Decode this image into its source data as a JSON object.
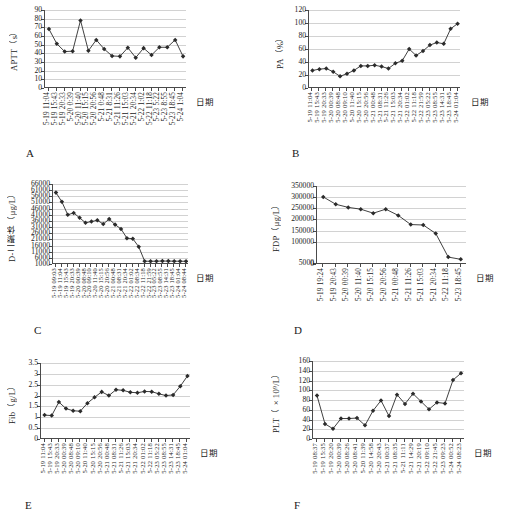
{
  "figure": {
    "axis_title_cn": "日期",
    "panels": [
      {
        "letter": "A",
        "chart_data": {
          "type": "line",
          "title": "",
          "ylabel": "APTT（s）",
          "ylabel_main": "APTT",
          "ylabel_unit": "（s）",
          "xlabel": "日期",
          "ylim": [
            0,
            90
          ],
          "yticks": [
            0,
            10,
            20,
            30,
            40,
            50,
            60,
            70,
            80,
            90
          ],
          "grid": true,
          "legend": "none",
          "categories": [
            "5-19 11:04",
            "5-19 15:43",
            "5-19 20:33",
            "5-20 0:39",
            "5-20 11:40",
            "5-20 15:15",
            "5-20 20:56",
            "5-21 0:48",
            "5-21 8:31",
            "5-21 11:26",
            "5-21 15:03",
            "5-21 20:34",
            "5-22 1:02",
            "5-22 11:18",
            "5-23 5:22",
            "5-23 8:55",
            "5-23 18:45",
            "5-24 1:04"
          ],
          "values": [
            68,
            51,
            42,
            42.5,
            78,
            43,
            55.5,
            45,
            37,
            36.5,
            46.5,
            35,
            46,
            38,
            47,
            47,
            55.5,
            36.5
          ]
        }
      },
      {
        "letter": "B",
        "chart_data": {
          "type": "line",
          "title": "",
          "ylabel": "PA（%）",
          "ylabel_main": "PA",
          "ylabel_unit": "（%）",
          "xlabel": "日期",
          "ylim": [
            0,
            120
          ],
          "yticks": [
            0,
            20,
            40,
            60,
            80,
            100,
            120
          ],
          "grid": true,
          "legend": "none",
          "categories": [
            "5-19 11:04",
            "5-19 15:43",
            "5-19 20:33",
            "5-20 00:39",
            "5-20 08:48",
            "5-20 09:10",
            "5-20 11:40",
            "5-20 15:15",
            "5-20 20:56",
            "5-21 00:48",
            "5-21 08:31",
            "5-21 11:26",
            "5-21 15:03",
            "5-21 20:34",
            "5-22 01:02",
            "5-22 11:18",
            "5-22 21:59",
            "5-23 05:22",
            "5-23 08:55",
            "5-23 14:31",
            "5-23 18:45",
            "5-24 01:04"
          ],
          "values": [
            27,
            29,
            30,
            25,
            18,
            22,
            27,
            34,
            34,
            35,
            33,
            30,
            38,
            42,
            60,
            50,
            57,
            66,
            70,
            68,
            91,
            99
          ]
        }
      },
      {
        "letter": "C",
        "chart_data": {
          "type": "line",
          "title": "",
          "ylabel": "D-二聚体（μg/L）",
          "ylabel_main": "D-二聚体",
          "ylabel_unit": "（μg/L）",
          "xlabel": "日期",
          "ylim": [
            1000,
            66000
          ],
          "yticks": [
            1000,
            6000,
            11000,
            16000,
            21000,
            26000,
            31000,
            36000,
            41000,
            46000,
            51000,
            56000,
            61000,
            66000
          ],
          "grid": true,
          "legend": "none",
          "categories": [
            "5-19 09:03",
            "5-19 11:04",
            "5-19 15:43",
            "5-19 20:33",
            "5-20 00:39",
            "5-20 08:48",
            "5-20 09:10",
            "5-20 11:40",
            "5-20 15:15",
            "5-20 20:56",
            "5-21 00:48",
            "5-21 08:31",
            "5-21 20:34",
            "5-22 01:02",
            "5-22 08:34",
            "5-22 11:18",
            "5-22 21:59",
            "5-23 05:22",
            "5-23 08:55",
            "5-23 14:31",
            "5-23 18:45",
            "5-24 01:04",
            "5-24 08:44"
          ],
          "values": [
            59000,
            51500,
            41000,
            42500,
            38500,
            34500,
            35500,
            36500,
            33500,
            37500,
            33000,
            29500,
            22000,
            21500,
            15000,
            3300,
            3200,
            3300,
            3400,
            3350,
            3300,
            3250,
            3200
          ]
        }
      },
      {
        "letter": "D",
        "chart_data": {
          "type": "line",
          "title": "",
          "ylabel": "FDP（μg/L）",
          "ylabel_main": "FDP",
          "ylabel_unit": "（μg/L）",
          "xlabel": "日期",
          "ylim": [
            0,
            350000
          ],
          "yticks": [
            0,
            5000,
            100000,
            150000,
            200000,
            250000,
            300000,
            350000
          ],
          "ytick_labels": [
            "0",
            "5000",
            "100000",
            "150000",
            "200000",
            "250000",
            "300000",
            "350000"
          ],
          "grid": true,
          "legend": "none",
          "categories": [
            "5-19 19:24",
            "5-19 20:43",
            "5-20 00:39",
            "5-20 11:40",
            "5-20 15:15",
            "5-20 20:56",
            "5-21 00:48",
            "5-21 11:26",
            "5-21 15:03",
            "5-21 20:34",
            "5-22 11:18",
            "5-23 18:45"
          ],
          "values": [
            301000,
            268000,
            254000,
            246000,
            228000,
            246000,
            218000,
            177000,
            175000,
            137000,
            31000,
            21000
          ]
        }
      },
      {
        "letter": "E",
        "chart_data": {
          "type": "line",
          "title": "",
          "ylabel": "Fib（g/L）",
          "ylabel_main": "Fib",
          "ylabel_unit": "（g/L）",
          "xlabel": "日期",
          "ylim": [
            0,
            3.5
          ],
          "yticks": [
            0,
            0.5,
            1,
            1.5,
            2,
            2.5,
            3,
            3.5
          ],
          "grid": true,
          "legend": "none",
          "categories": [
            "5-19 11:04",
            "5-19 15:43",
            "5-19 20:33",
            "5-20 00:39",
            "5-20 08:48",
            "5-20 09:10",
            "5-20 11:40",
            "5-20 15:15",
            "5-20 20:56",
            "5-21 00:48",
            "5-21 08:31",
            "5-21 11:26",
            "5-21 15:03",
            "5-21 20:34",
            "5-22 01:02",
            "5-22 11:18",
            "5-23 05:22",
            "5-23 08:55",
            "5-23 14:31",
            "5-23 18:45",
            "5-24 01:04"
          ],
          "values": [
            1.1,
            1.08,
            1.7,
            1.4,
            1.3,
            1.28,
            1.65,
            1.92,
            2.17,
            2.0,
            2.27,
            2.24,
            2.15,
            2.13,
            2.19,
            2.18,
            2.08,
            2.0,
            2.03,
            2.43,
            2.9
          ]
        }
      },
      {
        "letter": "F",
        "chart_data": {
          "type": "line",
          "title": "",
          "ylabel": "PLT（×10⁹/L）",
          "ylabel_main": "PLT",
          "ylabel_unit": "（×10⁹/L）",
          "xlabel": "日期",
          "ylim": [
            0,
            160
          ],
          "yticks": [
            0,
            20,
            40,
            60,
            80,
            100,
            120,
            140,
            160
          ],
          "grid": true,
          "legend": "none",
          "categories": [
            "5-19 08:37",
            "5-19 15:35",
            "5-19 20:20",
            "5-20 00:39",
            "5-20 08:26",
            "5-20 08:41",
            "5-20 11:39",
            "5-20 14:58",
            "5-20 20:43",
            "5-21 00:37",
            "5-21 08:35",
            "5-21 11:11",
            "5-21 14:29",
            "5-21 20:19",
            "5-22 09:10",
            "5-22 21:45",
            "5-23 09:23",
            "5-24 00:52",
            "5-24 08:23"
          ],
          "values": [
            89,
            31,
            21,
            42,
            42,
            43,
            28,
            58,
            79,
            47,
            91,
            72,
            93,
            77,
            61,
            75,
            73,
            121,
            135
          ]
        }
      }
    ]
  }
}
